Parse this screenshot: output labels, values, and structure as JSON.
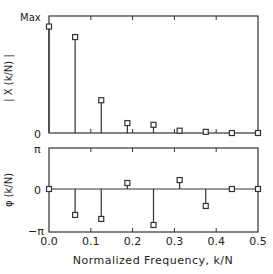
{
  "chart_data": [
    {
      "type": "stem",
      "title": "",
      "xlabel": "Normalized Frequency, k/N",
      "ylabel": "| X (k/N) |",
      "x": [
        0.0,
        0.0625,
        0.125,
        0.1875,
        0.25,
        0.3125,
        0.375,
        0.4375,
        0.5
      ],
      "values": [
        0.91,
        0.82,
        0.28,
        0.085,
        0.07,
        0.02,
        0.01,
        0.0,
        0.0
      ],
      "ylim": [
        0,
        1
      ],
      "ytick_labels": [
        "0",
        "Max"
      ],
      "xlim": [
        0,
        0.5
      ],
      "marker": "square"
    },
    {
      "type": "stem",
      "title": "",
      "xlabel": "Normalized Frequency, k/N",
      "ylabel": "φ (k/N)",
      "x": [
        0.0,
        0.0625,
        0.125,
        0.1875,
        0.25,
        0.3125,
        0.375,
        0.4375,
        0.5
      ],
      "values": [
        0.0,
        -1.94,
        -2.24,
        0.45,
        -2.69,
        0.67,
        -1.27,
        0.0,
        0.0
      ],
      "ylim": [
        -3.1416,
        3.1416
      ],
      "ytick_labels": [
        "-π",
        "0",
        "π"
      ],
      "xlim": [
        0,
        0.5
      ],
      "xticks": [
        0.0,
        0.1,
        0.2,
        0.3,
        0.4,
        0.5
      ],
      "xtick_labels": [
        "0.0",
        "0.1",
        "0.2",
        "0.3",
        "0.4",
        "0.5"
      ],
      "marker": "square"
    }
  ],
  "labels": {
    "top_ylabel": "| X (k/N) |",
    "top_ymax": "Max",
    "top_ymin": "0",
    "bot_ylabel": "φ (k/N)",
    "bot_ymax": "π",
    "bot_yzero": "0",
    "bot_ymin": "−π",
    "xlabel": "Normalized Frequency, k/N",
    "xticks": [
      "0.0",
      "0.1",
      "0.2",
      "0.3",
      "0.4",
      "0.5"
    ]
  }
}
